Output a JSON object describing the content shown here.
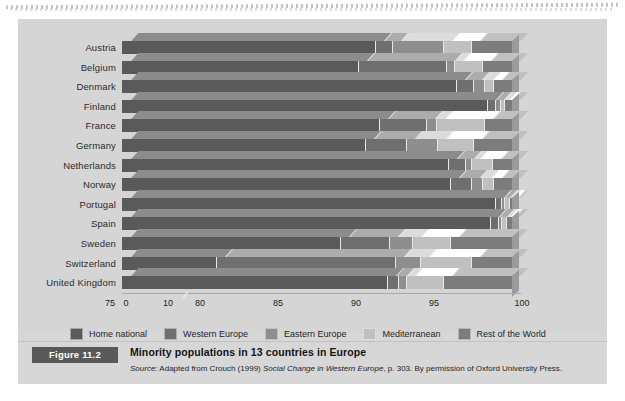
{
  "figure": {
    "tag": "Figure 11.2",
    "title": "Minority populations in 13 countries in Europe",
    "source_prefix": "Source:",
    "source_text_1": " Adapted from Crouch (1999) ",
    "source_italic": "Social Change in Western Europe",
    "source_text_2": ", p. 303. By permission of Oxford University Press."
  },
  "legend": {
    "items": [
      {
        "label": "Home national",
        "color": "#5a5a5a"
      },
      {
        "label": "Western Europe",
        "color": "#6f6f6f"
      },
      {
        "label": "Eastern Europe",
        "color": "#8e8e8e"
      },
      {
        "label": "Mediterranean",
        "color": "#c0c0c0"
      },
      {
        "label": "Rest of the World",
        "color": "#7c7c7c"
      }
    ]
  },
  "axis": {
    "ticks": [
      "0",
      "10",
      "75",
      "80",
      "85",
      "90",
      "95",
      "100"
    ],
    "break_symbol": "∕∕",
    "has_break": true,
    "break_between": [
      "10",
      "75"
    ]
  },
  "chart_data": {
    "type": "bar",
    "orientation": "horizontal",
    "stacked": true,
    "stack_total": 100,
    "title": "Minority populations in 13 countries in Europe",
    "xlabel": "",
    "ylabel": "",
    "xlim": [
      75,
      100
    ],
    "axis_break": {
      "from": 10,
      "to": 75,
      "shown_ticks": [
        0,
        10,
        75,
        80,
        85,
        90,
        95,
        100
      ]
    },
    "grid": false,
    "legend_position": "bottom",
    "categories": [
      "Austria",
      "Belgium",
      "Denmark",
      "Finland",
      "France",
      "Germany",
      "Netherlands",
      "Norway",
      "Portugal",
      "Spain",
      "Sweden",
      "Switzerland",
      "United Kingdom"
    ],
    "series": [
      {
        "name": "Home national",
        "values": [
          91.2,
          90.1,
          96.4,
          98.4,
          91.5,
          90.6,
          95.9,
          96.0,
          98.9,
          98.6,
          89.0,
          81.0,
          92.0
        ]
      },
      {
        "name": "Western Europe",
        "values": [
          1.1,
          5.7,
          1.1,
          0.5,
          3.0,
          2.6,
          1.1,
          1.4,
          0.4,
          0.5,
          3.1,
          11.5,
          0.7
        ]
      },
      {
        "name": "Eastern Europe",
        "values": [
          3.3,
          0.5,
          0.7,
          0.3,
          0.6,
          2.0,
          0.4,
          0.7,
          0.2,
          0.2,
          1.5,
          1.6,
          0.5
        ]
      },
      {
        "name": "Mediterranean",
        "values": [
          1.8,
          1.8,
          0.6,
          0.3,
          3.1,
          2.3,
          1.3,
          0.7,
          0.3,
          0.3,
          2.4,
          3.3,
          2.4
        ]
      },
      {
        "name": "Rest of the World",
        "values": [
          2.6,
          1.9,
          1.2,
          0.5,
          1.8,
          2.5,
          1.3,
          1.2,
          0.2,
          0.4,
          4.0,
          2.6,
          4.4
        ]
      }
    ]
  }
}
